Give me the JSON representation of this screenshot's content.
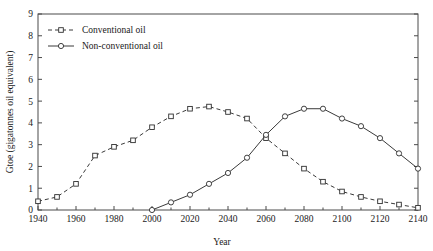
{
  "chart_data": {
    "type": "line",
    "title": "",
    "xlabel": "Year",
    "ylabel": "Gtoe (gigatonnes oil equivalent)",
    "xlim": [
      1940,
      2140
    ],
    "ylim": [
      0,
      9
    ],
    "xticks": [
      1940,
      1960,
      1980,
      2000,
      2020,
      2040,
      2060,
      2080,
      2100,
      2120,
      2140
    ],
    "yticks": [
      0,
      1,
      2,
      3,
      4,
      5,
      6,
      7,
      8,
      9
    ],
    "grid": false,
    "legend_position": "top-left",
    "series": [
      {
        "name": "Conventional oil",
        "marker": "square",
        "linestyle": "dashed",
        "x": [
          1940,
          1950,
          1960,
          1970,
          1980,
          1990,
          2000,
          2010,
          2020,
          2030,
          2040,
          2050,
          2060,
          2070,
          2080,
          2090,
          2100,
          2110,
          2120,
          2130,
          2140
        ],
        "values": [
          0.4,
          0.6,
          1.2,
          2.5,
          2.9,
          3.2,
          3.8,
          4.3,
          4.65,
          4.75,
          4.5,
          4.2,
          3.3,
          2.6,
          1.9,
          1.3,
          0.85,
          0.6,
          0.4,
          0.25,
          0.1
        ]
      },
      {
        "name": "Non-conventional oil",
        "marker": "circle",
        "linestyle": "solid",
        "x": [
          2000,
          2010,
          2020,
          2030,
          2040,
          2050,
          2060,
          2070,
          2080,
          2090,
          2100,
          2110,
          2120,
          2130,
          2140
        ],
        "values": [
          0.0,
          0.35,
          0.7,
          1.2,
          1.7,
          2.4,
          3.45,
          4.3,
          4.65,
          4.65,
          4.2,
          3.85,
          3.3,
          2.6,
          1.9
        ]
      }
    ]
  },
  "legend": {
    "items": [
      {
        "label": "Conventional oil"
      },
      {
        "label": "Non-conventional oil"
      }
    ]
  },
  "axes": {
    "x_title": "Year",
    "y_title": "Gtoe (gigatonnes oil equivalent)",
    "x_tick_labels": [
      "1940",
      "1960",
      "1980",
      "2000",
      "2020",
      "2040",
      "2060",
      "2080",
      "2100",
      "2120",
      "2140"
    ],
    "y_tick_labels": [
      "0",
      "1",
      "2",
      "3",
      "4",
      "5",
      "6",
      "7",
      "8",
      "9"
    ]
  }
}
